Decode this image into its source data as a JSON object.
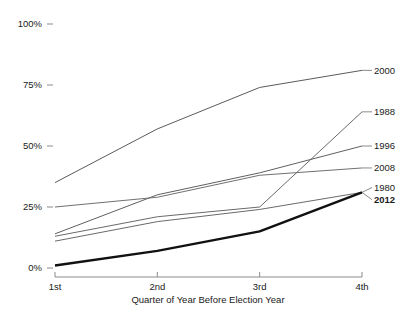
{
  "chart_data": {
    "type": "line",
    "title": "",
    "subtitle": "",
    "xlabel": "Quarter of Year Before Election Year",
    "ylabel": "",
    "categories": [
      "1st",
      "2nd",
      "3rd",
      "4th"
    ],
    "x_tick_labels": [
      "1st",
      "2nd",
      "3rd",
      "4th"
    ],
    "y_tick_labels": [
      "0%",
      "25%",
      "50%",
      "75%",
      "100%"
    ],
    "y_tick_values": [
      0,
      25,
      50,
      75,
      100
    ],
    "ylim": [
      0,
      100
    ],
    "grid": false,
    "legend_position": "right-inline-labels",
    "series": [
      {
        "name": "2000",
        "label": "2000",
        "values": [
          35,
          57,
          74,
          81
        ],
        "color": "#5a5a5a",
        "width": 1,
        "bold": false
      },
      {
        "name": "1988",
        "label": "1988",
        "values": [
          13,
          21,
          25,
          64
        ],
        "color": "#6a6a6a",
        "width": 1,
        "bold": false
      },
      {
        "name": "1996",
        "label": "1996",
        "values": [
          14,
          30,
          39,
          50
        ],
        "color": "#5f5f5f",
        "width": 1,
        "bold": false
      },
      {
        "name": "2008",
        "label": "2008",
        "values": [
          25,
          29,
          38,
          41
        ],
        "color": "#707070",
        "width": 1,
        "bold": false
      },
      {
        "name": "1980",
        "label": "1980",
        "values": [
          11,
          19,
          24,
          31
        ],
        "color": "#6a6a6a",
        "width": 1,
        "bold": false
      },
      {
        "name": "2012",
        "label": "2012",
        "values": [
          1,
          7,
          15,
          31
        ],
        "color": "#111111",
        "width": 2.4,
        "bold": true
      }
    ],
    "series_label_y_percent": {
      "2000": 81,
      "1988": 64,
      "1996": 50,
      "2008": 41,
      "1980": 33,
      "2012": 28
    }
  }
}
